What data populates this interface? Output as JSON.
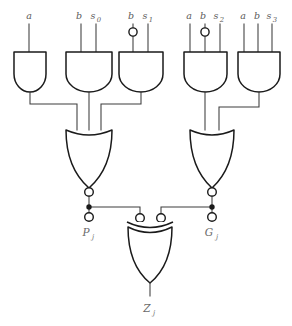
{
  "diagram": {
    "background_color": "#ffffff",
    "line_color": "#3c3c3c",
    "gate_outline_color": "#1a1a1a",
    "label_color": "#5a5a5a"
  },
  "input_labels": {
    "gate1": {
      "full": "a",
      "parts": [
        "a"
      ]
    },
    "gate2_b": "b",
    "gate2_s": "s",
    "gate2_s_sub": "0",
    "gate3_b": "b",
    "gate3_s": "s",
    "gate3_s_sub": "1",
    "gate4_a": "a",
    "gate4_b": "b",
    "gate4_s": "s",
    "gate4_s_sub": "2",
    "gate5_a": "a",
    "gate5_b": "b",
    "gate5_s": "s",
    "gate5_s_sub": "3"
  },
  "output_labels": {
    "p": "P",
    "p_sub": "j",
    "g": "G",
    "g_sub": "j",
    "z": "Z",
    "z_sub": "j"
  },
  "gates": [
    {
      "id": "and1",
      "type": "and",
      "inputs": 1,
      "inverted_inputs": [],
      "label": "AND gate 1"
    },
    {
      "id": "and2",
      "type": "and",
      "inputs": 2,
      "inverted_inputs": [],
      "label": "AND gate 2"
    },
    {
      "id": "and3",
      "type": "and",
      "inputs": 2,
      "inverted_inputs": [
        0
      ],
      "label": "AND gate 3"
    },
    {
      "id": "and4",
      "type": "and",
      "inputs": 3,
      "inverted_inputs": [
        1
      ],
      "label": "AND gate 4"
    },
    {
      "id": "and5",
      "type": "and",
      "inputs": 3,
      "inverted_inputs": [],
      "label": "AND gate 5"
    },
    {
      "id": "nor-left",
      "type": "nor",
      "inputs": 3,
      "inverted_inputs": [],
      "label": "NOR gate left"
    },
    {
      "id": "nor-right",
      "type": "nor",
      "inputs": 2,
      "inverted_inputs": [],
      "label": "NOR gate right"
    },
    {
      "id": "xnor-bottom",
      "type": "xor",
      "inputs": 2,
      "inverted_inputs": [
        0,
        1
      ],
      "label": "XOR gate bottom"
    }
  ],
  "terminals": [
    {
      "id": "p-terminal",
      "label": "Pj"
    },
    {
      "id": "g-terminal",
      "label": "Gj"
    },
    {
      "id": "z-output",
      "label": "Zj"
    }
  ]
}
